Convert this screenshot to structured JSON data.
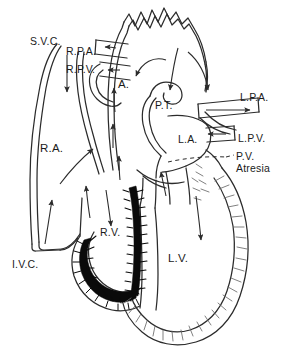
{
  "figure": {
    "type": "anatomical-diagram",
    "background_color": "#ffffff",
    "line_color": "#2b2b2b",
    "fill_right_ventricle_endocardium": "#0a0a0a",
    "fill_chamber": "#ffffff",
    "label_color": "#1b1b1b"
  },
  "labels": [
    {
      "id": "svc",
      "text": "S.V.C.",
      "x": 30,
      "y": 36,
      "size": "md",
      "meaning": "superior vena cava"
    },
    {
      "id": "rpa",
      "text": "R.P.A.",
      "x": 66,
      "y": 46,
      "size": "md",
      "meaning": "right pulmonary artery"
    },
    {
      "id": "rpv",
      "text": "R.P.V.",
      "x": 66,
      "y": 64,
      "size": "md",
      "meaning": "right pulmonary vein"
    },
    {
      "id": "aorta",
      "text": "A.",
      "x": 118,
      "y": 78,
      "size": "lg",
      "meaning": "aorta"
    },
    {
      "id": "pt",
      "text": "P.T.",
      "x": 155,
      "y": 100,
      "size": "md",
      "meaning": "pulmonary trunk"
    },
    {
      "id": "lpa",
      "text": "L.P.A.",
      "x": 240,
      "y": 92,
      "size": "md",
      "meaning": "left pulmonary artery"
    },
    {
      "id": "la",
      "text": "L.A.",
      "x": 178,
      "y": 134,
      "size": "md",
      "meaning": "left atrium"
    },
    {
      "id": "lpv",
      "text": "L.P.V.",
      "x": 238,
      "y": 133,
      "size": "md",
      "meaning": "left pulmonary vein"
    },
    {
      "id": "ra",
      "text": "R.A.",
      "x": 40,
      "y": 142,
      "size": "lg",
      "meaning": "right atrium"
    },
    {
      "id": "rv",
      "text": "R.V.",
      "x": 100,
      "y": 227,
      "size": "md",
      "meaning": "right ventricle"
    },
    {
      "id": "lv",
      "text": "L.V.",
      "x": 168,
      "y": 252,
      "size": "lg",
      "meaning": "left ventricle"
    },
    {
      "id": "ivc",
      "text": "I.V.C.",
      "x": 12,
      "y": 259,
      "size": "md",
      "meaning": "inferior vena cava"
    }
  ],
  "annotation_pv_atresia": {
    "id": "pv-atresia",
    "line1": "P.V.",
    "line2": "Atresia",
    "x": 236,
    "y": 151,
    "size": "md",
    "meaning": "pulmonary valve atresia",
    "leader": "dashed"
  },
  "flow_arrows": [
    {
      "id": "svc-inflow",
      "direction": "down",
      "chamber": "right-atrium"
    },
    {
      "id": "ivc-inflow",
      "direction": "up",
      "chamber": "right-atrium"
    },
    {
      "id": "ra-to-la-shunt",
      "direction": "up-left-to-right",
      "chamber": "atrial-septum"
    },
    {
      "id": "rv-inflow",
      "direction": "down",
      "chamber": "right-ventricle"
    },
    {
      "id": "rv-outflow-blocked",
      "direction": "up",
      "chamber": "right-ventricle"
    },
    {
      "id": "lv-inflow",
      "direction": "down",
      "chamber": "left-ventricle"
    },
    {
      "id": "lv-to-aorta",
      "direction": "up",
      "chamber": "aorta"
    },
    {
      "id": "ductus-to-lpa",
      "direction": "right",
      "chamber": "ductus-arteriosus"
    },
    {
      "id": "arch-to-lpa",
      "direction": "down-right",
      "chamber": "aortic-arch"
    },
    {
      "id": "arch-to-pt",
      "direction": "down-left",
      "chamber": "aortic-arch"
    },
    {
      "id": "rpa-retrograde",
      "direction": "left",
      "chamber": "right-pulmonary-artery"
    },
    {
      "id": "rpv-inflow",
      "direction": "left",
      "chamber": "right-pulmonary-vein"
    },
    {
      "id": "lpv-inflow",
      "direction": "left",
      "chamber": "left-pulmonary-vein"
    },
    {
      "id": "lpa-flow",
      "direction": "right",
      "chamber": "left-pulmonary-artery"
    }
  ]
}
